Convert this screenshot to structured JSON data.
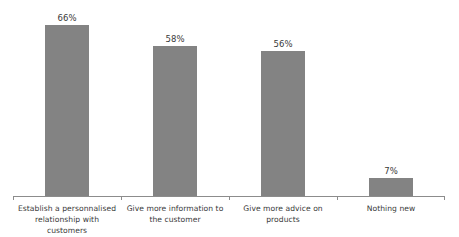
{
  "chart_data": {
    "type": "bar",
    "title": "",
    "subtitle": "",
    "xlabel": "",
    "ylabel": "",
    "ylim": [
      0,
      75
    ],
    "grid": false,
    "legend": false,
    "legend_position": "none",
    "orientation": "vertical",
    "value_suffix": "%",
    "categories": [
      "Establish a personnalised relationship with customers",
      "Give more information to the customer",
      "Give more advice on products",
      "Nothing new"
    ],
    "values": [
      66,
      58,
      56,
      7
    ],
    "value_labels": [
      "66%",
      "58%",
      "56%",
      "7%"
    ],
    "bar_color": "#838383",
    "axis_color": "#8c8c8c",
    "text_color": "#3a3a3a",
    "background_color": "#ffffff"
  }
}
